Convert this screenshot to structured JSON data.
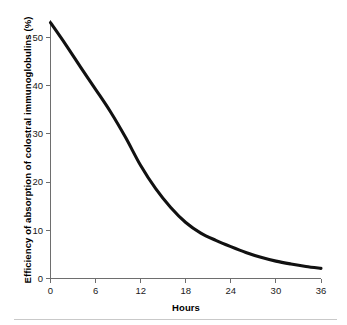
{
  "chart_data": {
    "type": "line",
    "title": "",
    "xlabel": "Hours",
    "ylabel": "Efficiency of absorption of colostral immunoglobulins (%)",
    "xlim": [
      0,
      36
    ],
    "ylim": [
      0,
      55
    ],
    "xticks": [
      0,
      6,
      12,
      18,
      24,
      30,
      36
    ],
    "yticks": [
      0,
      10,
      20,
      30,
      40,
      50
    ],
    "xticklabels": [
      "0",
      "6",
      "12",
      "18",
      "24",
      "30",
      "36"
    ],
    "yticklabels": [
      "0",
      "10",
      "20",
      "30",
      "40",
      "50"
    ],
    "grid": false,
    "legend": false,
    "legend_position": "none",
    "series": [
      {
        "name": "Efficiency of absorption",
        "color": "#111111",
        "line_width": 3.1,
        "x": [
          0,
          2,
          4,
          6,
          8,
          10,
          12,
          14,
          16,
          18,
          20,
          22,
          24,
          26,
          28,
          30,
          32,
          34,
          36
        ],
        "values": [
          53.0,
          48.5,
          43.8,
          39.2,
          34.5,
          29.2,
          23.4,
          18.6,
          14.7,
          11.6,
          9.4,
          7.9,
          6.6,
          5.4,
          4.4,
          3.6,
          3.0,
          2.5,
          2.1
        ]
      }
    ],
    "annotations": []
  },
  "axes": {
    "x_title": "Hours",
    "y_title": "Efficiency of absorption of colostral immunoglobulins (%)",
    "axis_color": "#6e6e6e",
    "curve_color": "#111111",
    "background_color": "#ffffff"
  }
}
